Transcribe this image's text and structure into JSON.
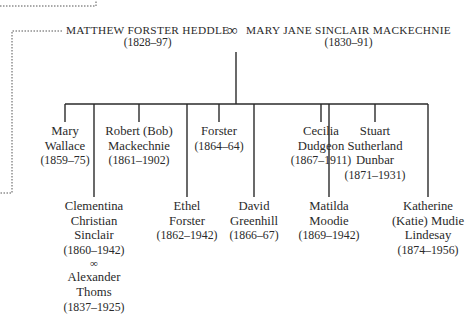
{
  "diagram": {
    "type": "family-tree",
    "parents": {
      "father": {
        "name": "MATTHEW FORSTER HEDDLE",
        "dates": "(1828–97)"
      },
      "marriage_symbol": "∞",
      "mother": {
        "name": "MARY JANE SINCLAIR MACKECHNIE",
        "dates": "(1830–91)"
      }
    },
    "children": [
      {
        "id": "mary",
        "lines": [
          "Mary",
          "Wallace"
        ],
        "dates": "(1859–75)",
        "row": "upper"
      },
      {
        "id": "clementina",
        "lines": [
          "Clementina",
          "Christian",
          "Sinclair"
        ],
        "dates": "(1860–1942)",
        "row": "lower",
        "spouse": {
          "symbol": "∞",
          "lines": [
            "Alexander",
            "Thoms"
          ],
          "dates": "(1837–1925)"
        }
      },
      {
        "id": "robert",
        "lines": [
          "Robert (Bob)",
          "Mackechnie"
        ],
        "dates": "(1861–1902)",
        "row": "upper"
      },
      {
        "id": "ethel",
        "lines": [
          "Ethel",
          "Forster"
        ],
        "dates": "(1862–1942)",
        "row": "lower"
      },
      {
        "id": "forster",
        "lines": [
          "Forster"
        ],
        "dates": "(1864–64)",
        "row": "upper"
      },
      {
        "id": "david",
        "lines": [
          "David",
          "Greenhill"
        ],
        "dates": "(1866–67)",
        "row": "lower"
      },
      {
        "id": "cecilia",
        "lines": [
          "Cecilia",
          "Dudgeon"
        ],
        "dates": "(1867–1911)",
        "row": "upper"
      },
      {
        "id": "matilda",
        "lines": [
          "Matilda",
          "Moodie"
        ],
        "dates": "(1869–1942)",
        "row": "lower"
      },
      {
        "id": "stuart",
        "lines": [
          "Stuart",
          "Sutherland",
          "Dunbar"
        ],
        "dates": "(1871–1931)",
        "row": "upper"
      },
      {
        "id": "katherine",
        "lines": [
          "Katherine",
          "(Katie) Mudie",
          "Lindesay"
        ],
        "dates": "(1874–1956)",
        "row": "lower"
      }
    ],
    "colors": {
      "line": "#2a2a2a",
      "dotted_line": "#555555",
      "background": "#ffffff"
    }
  }
}
